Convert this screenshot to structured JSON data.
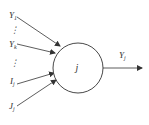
{
  "diagram": {
    "type": "neuron-node",
    "node": {
      "label": "j",
      "cx": 78,
      "cy": 68,
      "r": 25
    },
    "inputs": [
      {
        "label": "Y",
        "sub": "1",
        "x": 9,
        "y": 18,
        "from": [
          17,
          17
        ],
        "to": [
          60,
          46
        ]
      },
      {
        "label": "⋮",
        "sub": "",
        "x": 10,
        "y": 33
      },
      {
        "label": "Y",
        "sub": "k",
        "x": 9,
        "y": 47,
        "from": [
          17,
          44
        ],
        "to": [
          55,
          53
        ]
      },
      {
        "label": "⋮",
        "sub": "",
        "x": 10,
        "y": 66
      },
      {
        "label": "I",
        "sub": "j",
        "x": 10,
        "y": 84,
        "from": [
          17,
          84
        ],
        "to": [
          54,
          73
        ]
      },
      {
        "label": "J",
        "sub": "j",
        "x": 9,
        "y": 109,
        "from": [
          17,
          106
        ],
        "to": [
          56,
          80
        ]
      }
    ],
    "output": {
      "label": "Y",
      "sub": "j",
      "x": 119,
      "y": 58,
      "from": [
        103,
        68
      ],
      "to": [
        142,
        68
      ]
    },
    "colors": {
      "stroke": "#333333",
      "background": "#ffffff"
    }
  }
}
